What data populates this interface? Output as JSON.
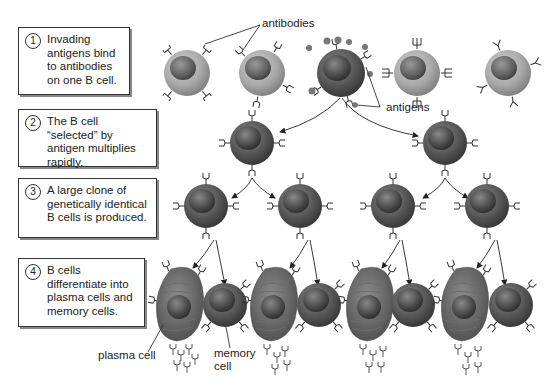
{
  "diagram": {
    "topic": "Clonal selection of B cells",
    "steps": [
      {
        "number": "1",
        "text": "Invading antigens bind to antibodies on one B cell."
      },
      {
        "number": "2",
        "text": "The B cell “selected” by antigen multiplies rapidly."
      },
      {
        "number": "3",
        "text": "A large clone of genetically identical B cells is produced."
      },
      {
        "number": "4",
        "text": "B cells differentiate into plasma cells and memory cells."
      }
    ],
    "labels": {
      "antibodies": "antibodies",
      "antigens": "antigens",
      "plasma_cell": "plasma cell",
      "memory_cell": "memory cell"
    },
    "colors": {
      "unselected_cell": "#a9a9a9",
      "selected_cell": "#555555",
      "nucleus": "#444444",
      "line": "#333333"
    },
    "rows": {
      "row1_cells": 5,
      "row2_cells": 2,
      "row3_cells": 4,
      "row4_pairs": 4
    }
  }
}
